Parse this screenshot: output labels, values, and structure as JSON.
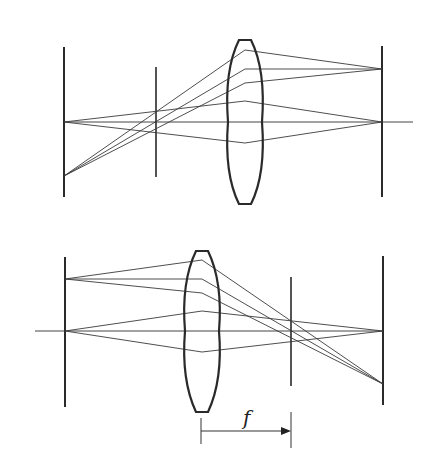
{
  "diagram": {
    "colors": {
      "line": "#2a2a2a",
      "background": "#ffffff"
    },
    "top": {
      "axis_y": 122,
      "axis_x_end": 413,
      "object_plane": {
        "x": 64,
        "y1": 47,
        "y2": 197
      },
      "aperture_plane": {
        "x": 156,
        "y1": 67,
        "y2": 177
      },
      "lens": {
        "cx": 245,
        "top": 40,
        "bottom": 204,
        "half_width": 17
      },
      "image_plane": {
        "x": 382,
        "y1": 46,
        "y2": 197
      },
      "ray_bundles": [
        {
          "name": "off-axis",
          "source": [
            64,
            176
          ],
          "target": [
            382,
            69
          ],
          "lens_hits": [
            50,
            69,
            83
          ]
        },
        {
          "name": "on-axis",
          "source": [
            64,
            122
          ],
          "target": [
            382,
            122
          ],
          "lens_hits": [
            101,
            122,
            143
          ]
        }
      ]
    },
    "bottom": {
      "axis_y": 331,
      "axis_x_start": 35,
      "object_plane": {
        "x": 65,
        "y1": 257,
        "y2": 407
      },
      "lens": {
        "cx": 202,
        "top": 251,
        "bottom": 412,
        "half_width": 17
      },
      "focal_plane": {
        "x": 291,
        "y1": 277,
        "y2": 386
      },
      "image_plane": {
        "x": 383,
        "y1": 256,
        "y2": 405
      },
      "ray_bundles": [
        {
          "name": "off-axis",
          "source": [
            65,
            279
          ],
          "target": [
            383,
            384
          ],
          "lens_hits": [
            260,
            279,
            293
          ]
        },
        {
          "name": "on-axis",
          "source": [
            65,
            331
          ],
          "target": [
            383,
            331
          ],
          "lens_hits": [
            311,
            331,
            352
          ]
        }
      ],
      "focal_length_marker": {
        "label": "f",
        "from_x": 201,
        "to_x": 291,
        "y": 431,
        "label_pos": [
          243,
          425
        ]
      }
    }
  }
}
